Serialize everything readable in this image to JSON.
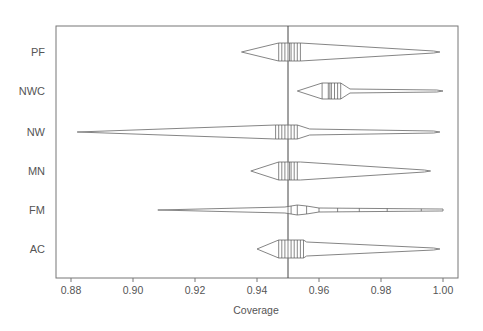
{
  "chart_data": {
    "type": "violin",
    "title": "",
    "xlabel": "Coverage",
    "ylabel": "",
    "xlim": [
      0.875,
      1.005
    ],
    "xticks": [
      0.88,
      0.9,
      0.92,
      0.94,
      0.96,
      0.98,
      1.0
    ],
    "xtick_labels": [
      "0.88",
      "0.90",
      "0.92",
      "0.94",
      "0.96",
      "0.98",
      "1.00"
    ],
    "reference_line": 0.95,
    "grid": false,
    "legend": null,
    "categories": [
      "PF",
      "NWC",
      "NW",
      "MN",
      "FM",
      "AC"
    ],
    "series": [
      {
        "name": "PF",
        "min": 0.935,
        "max": 0.999,
        "body_from": 0.947,
        "body_to": 0.954,
        "mode": 0.95,
        "profile": [
          [
            0.935,
            0
          ],
          [
            0.947,
            9
          ],
          [
            0.954,
            9
          ],
          [
            0.997,
            1
          ],
          [
            0.999,
            0
          ]
        ],
        "marks": [
          0.947,
          0.948,
          0.949,
          0.95,
          0.9505,
          0.951,
          0.952,
          0.953,
          0.954
        ]
      },
      {
        "name": "NWC",
        "min": 0.953,
        "max": 1.0,
        "body_from": 0.961,
        "body_to": 0.969,
        "mode": 0.964,
        "profile": [
          [
            0.953,
            0
          ],
          [
            0.961,
            8
          ],
          [
            0.967,
            8
          ],
          [
            0.969,
            4
          ],
          [
            0.97,
            2
          ],
          [
            0.998,
            1
          ],
          [
            1.0,
            0
          ]
        ],
        "marks": [
          0.961,
          0.963,
          0.9635,
          0.964,
          0.965,
          0.966,
          0.967
        ]
      },
      {
        "name": "NW",
        "min": 0.882,
        "max": 0.999,
        "body_from": 0.946,
        "body_to": 0.954,
        "mode": 0.95,
        "profile": [
          [
            0.882,
            0
          ],
          [
            0.946,
            7
          ],
          [
            0.953,
            7
          ],
          [
            0.957,
            3
          ],
          [
            0.997,
            1
          ],
          [
            0.999,
            0
          ]
        ],
        "marks": [
          0.946,
          0.947,
          0.948,
          0.949,
          0.95,
          0.951,
          0.952,
          0.953
        ]
      },
      {
        "name": "MN",
        "min": 0.938,
        "max": 0.996,
        "body_from": 0.947,
        "body_to": 0.954,
        "mode": 0.95,
        "profile": [
          [
            0.938,
            0
          ],
          [
            0.947,
            9
          ],
          [
            0.954,
            9
          ],
          [
            0.994,
            1
          ],
          [
            0.996,
            0
          ]
        ],
        "marks": [
          0.947,
          0.948,
          0.949,
          0.95,
          0.9505,
          0.951,
          0.952,
          0.953
        ]
      },
      {
        "name": "FM",
        "min": 0.908,
        "max": 1.0,
        "body_from": 0.949,
        "body_to": 0.956,
        "mode": 0.953,
        "profile": [
          [
            0.908,
            0
          ],
          [
            0.949,
            3
          ],
          [
            0.953,
            5
          ],
          [
            0.956,
            4
          ],
          [
            0.96,
            2
          ],
          [
            0.999,
            1
          ],
          [
            1.0,
            1
          ]
        ],
        "marks": [
          0.95,
          0.951,
          0.953,
          0.956,
          0.96,
          0.966,
          0.973,
          0.982,
          0.993
        ]
      },
      {
        "name": "AC",
        "min": 0.94,
        "max": 0.999,
        "body_from": 0.947,
        "body_to": 0.956,
        "mode": 0.951,
        "profile": [
          [
            0.94,
            0
          ],
          [
            0.947,
            9
          ],
          [
            0.955,
            9
          ],
          [
            0.956,
            7
          ],
          [
            0.997,
            1
          ],
          [
            0.999,
            0
          ]
        ],
        "marks": [
          0.947,
          0.948,
          0.949,
          0.95,
          0.951,
          0.952,
          0.953,
          0.954,
          0.955
        ]
      }
    ]
  },
  "colors": {
    "line": "#777777",
    "axis": "#777777",
    "text": "#555555",
    "background": "#ffffff"
  }
}
